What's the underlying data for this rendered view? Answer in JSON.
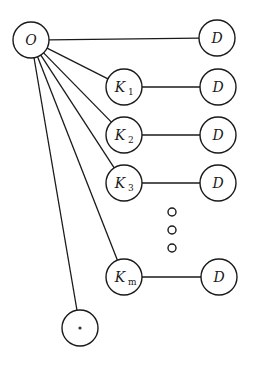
{
  "diagram": {
    "type": "graph",
    "colors": {
      "stroke": "#1a1a1a",
      "background": "#ffffff"
    },
    "node_radius": 18,
    "nodes": [
      {
        "id": "O",
        "label": "O",
        "sub": "",
        "x": 31,
        "y": 40
      },
      {
        "id": "D0",
        "label": "D",
        "sub": "",
        "x": 217,
        "y": 38
      },
      {
        "id": "K1",
        "label": "K",
        "sub": "1",
        "x": 124,
        "y": 87
      },
      {
        "id": "D1",
        "label": "D",
        "sub": "",
        "x": 218,
        "y": 87
      },
      {
        "id": "K2",
        "label": "K",
        "sub": "2",
        "x": 124,
        "y": 135
      },
      {
        "id": "D2",
        "label": "D",
        "sub": "",
        "x": 218,
        "y": 135
      },
      {
        "id": "K3",
        "label": "K",
        "sub": "3",
        "x": 124,
        "y": 183
      },
      {
        "id": "D3",
        "label": "D",
        "sub": "",
        "x": 218,
        "y": 183
      },
      {
        "id": "Km",
        "label": "K",
        "sub": "m",
        "x": 124,
        "y": 277
      },
      {
        "id": "Dm",
        "label": "D",
        "sub": "",
        "x": 219,
        "y": 277
      },
      {
        "id": "S",
        "label": "*",
        "sub": "",
        "x": 80,
        "y": 328
      }
    ],
    "edges": [
      [
        "O",
        "D0"
      ],
      [
        "O",
        "K1"
      ],
      [
        "O",
        "K2"
      ],
      [
        "O",
        "K3"
      ],
      [
        "O",
        "Km"
      ],
      [
        "O",
        "S"
      ],
      [
        "K1",
        "D1"
      ],
      [
        "K2",
        "D2"
      ],
      [
        "K3",
        "D3"
      ],
      [
        "Km",
        "Dm"
      ]
    ],
    "ellipsis": [
      {
        "x": 172,
        "y": 212
      },
      {
        "x": 172,
        "y": 230
      },
      {
        "x": 172,
        "y": 248
      }
    ]
  }
}
